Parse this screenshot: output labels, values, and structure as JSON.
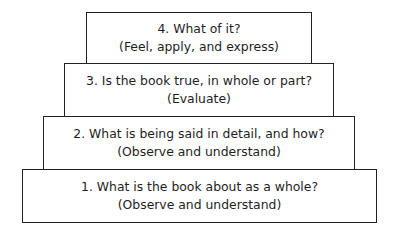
{
  "diagram": {
    "type": "stacked-pyramid",
    "steps": [
      {
        "number": 4,
        "question": "4. What of it?",
        "action": "(Feel, apply, and express)"
      },
      {
        "number": 3,
        "question": "3. Is the book true, in whole or part?",
        "action": "(Evaluate)"
      },
      {
        "number": 2,
        "question": "2. What is being said in detail, and how?",
        "action": "(Observe and understand)"
      },
      {
        "number": 1,
        "question": "1. What is the book about as a whole?",
        "action": "(Observe and understand)"
      }
    ]
  }
}
